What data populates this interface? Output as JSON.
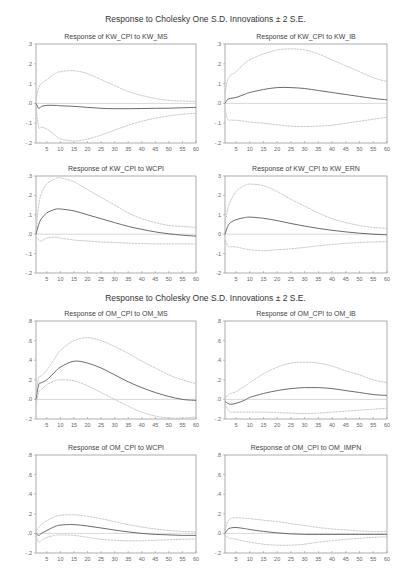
{
  "headers": [
    "Response to Cholesky One S.D. Innovations ± 2 S.E.",
    "Response to Cholesky One S.D. Innovations ± 2 S.E."
  ],
  "chart_data": [
    {
      "type": "line",
      "title": "Response of KW_CPI to KW_MS",
      "x_ticks": [
        5,
        10,
        15,
        20,
        25,
        30,
        35,
        40,
        45,
        50,
        55,
        60
      ],
      "y_ticks": [
        ".3",
        ".2",
        ".1",
        ".0",
        "-.1",
        "-.2"
      ],
      "ylim": [
        -0.2,
        0.3
      ],
      "xlim": [
        1,
        60
      ],
      "x": [
        1,
        2,
        3,
        5,
        8,
        10,
        15,
        20,
        25,
        30,
        35,
        40,
        45,
        50,
        55,
        60
      ],
      "series": [
        {
          "name": "response",
          "values": [
            0.0,
            -0.025,
            -0.015,
            -0.01,
            -0.01,
            -0.012,
            -0.015,
            -0.02,
            -0.025,
            -0.027,
            -0.027,
            -0.026,
            -0.025,
            -0.024,
            -0.022,
            -0.02
          ]
        },
        {
          "name": "upper_2se",
          "values": [
            0.02,
            0.08,
            0.1,
            0.12,
            0.15,
            0.16,
            0.165,
            0.15,
            0.12,
            0.09,
            0.06,
            0.04,
            0.025,
            0.015,
            0.012,
            0.01
          ]
        },
        {
          "name": "lower_2se",
          "values": [
            -0.02,
            -0.12,
            -0.12,
            -0.13,
            -0.16,
            -0.18,
            -0.19,
            -0.18,
            -0.16,
            -0.135,
            -0.11,
            -0.09,
            -0.075,
            -0.063,
            -0.055,
            -0.05
          ]
        }
      ]
    },
    {
      "type": "line",
      "title": "Response of KW_CPI to KW_IB",
      "x_ticks": [
        5,
        10,
        15,
        20,
        25,
        30,
        35,
        40,
        45,
        50,
        55,
        60
      ],
      "y_ticks": [
        ".3",
        ".2",
        ".1",
        ".0",
        "-.1",
        "-.2"
      ],
      "ylim": [
        -0.2,
        0.3
      ],
      "xlim": [
        1,
        60
      ],
      "x": [
        1,
        2,
        3,
        5,
        8,
        10,
        15,
        20,
        25,
        30,
        35,
        40,
        45,
        50,
        55,
        60
      ],
      "series": [
        {
          "name": "response",
          "values": [
            0.0,
            0.02,
            0.025,
            0.03,
            0.045,
            0.055,
            0.07,
            0.08,
            0.08,
            0.075,
            0.065,
            0.055,
            0.045,
            0.035,
            0.025,
            0.018
          ]
        },
        {
          "name": "upper_2se",
          "values": [
            0.05,
            0.12,
            0.14,
            0.16,
            0.2,
            0.22,
            0.25,
            0.27,
            0.275,
            0.27,
            0.25,
            0.22,
            0.19,
            0.16,
            0.13,
            0.11
          ]
        },
        {
          "name": "lower_2se",
          "values": [
            -0.03,
            -0.08,
            -0.085,
            -0.085,
            -0.09,
            -0.095,
            -0.1,
            -0.108,
            -0.115,
            -0.117,
            -0.115,
            -0.11,
            -0.1,
            -0.09,
            -0.08,
            -0.07
          ]
        }
      ]
    },
    {
      "type": "line",
      "title": "Response of KW_CPI to WCPI",
      "x_ticks": [
        5,
        10,
        15,
        20,
        25,
        30,
        35,
        40,
        45,
        50,
        55,
        60
      ],
      "y_ticks": [
        ".3",
        ".2",
        ".1",
        ".0",
        "-.1",
        "-.2"
      ],
      "ylim": [
        -0.2,
        0.3
      ],
      "xlim": [
        1,
        60
      ],
      "x": [
        1,
        2,
        3,
        5,
        8,
        10,
        15,
        20,
        25,
        30,
        35,
        40,
        45,
        50,
        55,
        60
      ],
      "series": [
        {
          "name": "response",
          "values": [
            0.0,
            0.05,
            0.08,
            0.11,
            0.128,
            0.13,
            0.12,
            0.1,
            0.08,
            0.06,
            0.04,
            0.025,
            0.012,
            0.002,
            -0.005,
            -0.01
          ]
        },
        {
          "name": "upper_2se",
          "values": [
            0.02,
            0.15,
            0.21,
            0.26,
            0.285,
            0.29,
            0.27,
            0.23,
            0.19,
            0.15,
            0.11,
            0.08,
            0.06,
            0.045,
            0.04,
            0.035
          ]
        },
        {
          "name": "lower_2se",
          "values": [
            -0.01,
            -0.03,
            -0.035,
            -0.02,
            -0.015,
            -0.02,
            -0.03,
            -0.035,
            -0.04,
            -0.043,
            -0.046,
            -0.048,
            -0.05,
            -0.05,
            -0.05,
            -0.05
          ]
        }
      ]
    },
    {
      "type": "line",
      "title": "Response of KW_CPI to KW_ERN",
      "x_ticks": [
        5,
        10,
        15,
        20,
        25,
        30,
        35,
        40,
        45,
        50,
        55,
        60
      ],
      "y_ticks": [
        "3",
        "2",
        "1",
        "0",
        "-1",
        "-2"
      ],
      "ylim": [
        -2,
        3
      ],
      "xlim": [
        1,
        60
      ],
      "x": [
        1,
        2,
        3,
        5,
        8,
        10,
        15,
        20,
        25,
        30,
        35,
        40,
        45,
        50,
        55,
        60
      ],
      "series": [
        {
          "name": "response",
          "values": [
            0.0,
            0.4,
            0.6,
            0.75,
            0.85,
            0.88,
            0.82,
            0.7,
            0.55,
            0.42,
            0.3,
            0.2,
            0.12,
            0.05,
            0.0,
            -0.03
          ]
        },
        {
          "name": "upper_2se",
          "values": [
            0.5,
            1.3,
            1.7,
            2.2,
            2.5,
            2.58,
            2.5,
            2.2,
            1.8,
            1.45,
            1.1,
            0.8,
            0.6,
            0.45,
            0.35,
            0.3
          ]
        },
        {
          "name": "lower_2se",
          "values": [
            -0.3,
            -0.6,
            -0.65,
            -0.65,
            -0.75,
            -0.8,
            -0.85,
            -0.8,
            -0.75,
            -0.68,
            -0.6,
            -0.53,
            -0.47,
            -0.43,
            -0.4,
            -0.38
          ]
        }
      ]
    },
    {
      "type": "line",
      "title": "Response of OM_CPI to OM_MS",
      "x_ticks": [
        5,
        10,
        15,
        20,
        25,
        30,
        35,
        40,
        45,
        50,
        55,
        60
      ],
      "y_ticks": [
        ".8",
        ".6",
        ".4",
        ".2",
        ".0",
        "-.2"
      ],
      "ylim": [
        -0.2,
        0.8
      ],
      "xlim": [
        1,
        60
      ],
      "x": [
        1,
        2,
        3,
        5,
        8,
        10,
        15,
        20,
        25,
        30,
        35,
        40,
        45,
        50,
        55,
        60
      ],
      "series": [
        {
          "name": "response",
          "values": [
            0.0,
            0.15,
            0.17,
            0.2,
            0.28,
            0.33,
            0.39,
            0.37,
            0.32,
            0.25,
            0.18,
            0.12,
            0.07,
            0.03,
            0.0,
            -0.01
          ]
        },
        {
          "name": "upper_2se",
          "values": [
            0.05,
            0.22,
            0.24,
            0.3,
            0.42,
            0.5,
            0.6,
            0.63,
            0.6,
            0.54,
            0.47,
            0.39,
            0.32,
            0.25,
            0.2,
            0.16
          ]
        },
        {
          "name": "lower_2se",
          "values": [
            -0.05,
            0.07,
            0.1,
            0.15,
            0.19,
            0.2,
            0.19,
            0.14,
            0.07,
            0.0,
            -0.07,
            -0.13,
            -0.17,
            -0.19,
            -0.19,
            -0.18
          ]
        }
      ]
    },
    {
      "type": "line",
      "title": "Response of OM_CPI to OM_IB",
      "x_ticks": [
        5,
        10,
        15,
        20,
        25,
        30,
        35,
        40,
        45,
        50,
        55,
        60
      ],
      "y_ticks": [
        ".8",
        ".6",
        ".4",
        ".2",
        ".0",
        "-.2"
      ],
      "ylim": [
        -0.2,
        0.8
      ],
      "xlim": [
        1,
        60
      ],
      "x": [
        1,
        2,
        3,
        5,
        8,
        10,
        15,
        20,
        25,
        30,
        35,
        40,
        45,
        50,
        55,
        60
      ],
      "series": [
        {
          "name": "response",
          "values": [
            -0.02,
            -0.04,
            -0.05,
            -0.04,
            -0.01,
            0.02,
            0.06,
            0.09,
            0.11,
            0.12,
            0.12,
            0.11,
            0.09,
            0.07,
            0.05,
            0.04
          ]
        },
        {
          "name": "upper_2se",
          "values": [
            0.02,
            0.04,
            0.06,
            0.08,
            0.13,
            0.17,
            0.26,
            0.33,
            0.37,
            0.38,
            0.37,
            0.34,
            0.29,
            0.25,
            0.2,
            0.17
          ]
        },
        {
          "name": "lower_2se",
          "values": [
            -0.05,
            -0.1,
            -0.13,
            -0.13,
            -0.13,
            -0.13,
            -0.13,
            -0.135,
            -0.14,
            -0.145,
            -0.14,
            -0.13,
            -0.12,
            -0.11,
            -0.1,
            -0.09
          ]
        }
      ]
    },
    {
      "type": "line",
      "title": "Response of OM_CPI to WCPI",
      "x_ticks": [
        5,
        10,
        15,
        20,
        25,
        30,
        35,
        40,
        45,
        50,
        55,
        60
      ],
      "y_ticks": [
        ".8",
        ".6",
        ".4",
        ".2",
        ".0",
        "-.2"
      ],
      "ylim": [
        -0.2,
        0.8
      ],
      "xlim": [
        1,
        60
      ],
      "x": [
        1,
        2,
        3,
        5,
        8,
        10,
        15,
        20,
        25,
        30,
        35,
        40,
        45,
        50,
        55,
        60
      ],
      "series": [
        {
          "name": "response",
          "values": [
            0.0,
            -0.02,
            0.0,
            0.03,
            0.07,
            0.085,
            0.09,
            0.075,
            0.055,
            0.035,
            0.015,
            0.0,
            -0.01,
            -0.015,
            -0.02,
            -0.02
          ]
        },
        {
          "name": "upper_2se",
          "values": [
            0.03,
            0.06,
            0.09,
            0.13,
            0.17,
            0.185,
            0.19,
            0.175,
            0.15,
            0.12,
            0.09,
            0.065,
            0.045,
            0.03,
            0.02,
            0.015
          ]
        },
        {
          "name": "lower_2se",
          "values": [
            -0.03,
            -0.09,
            -0.07,
            -0.04,
            -0.02,
            -0.015,
            -0.02,
            -0.04,
            -0.06,
            -0.07,
            -0.075,
            -0.075,
            -0.07,
            -0.065,
            -0.06,
            -0.055
          ]
        }
      ]
    },
    {
      "type": "line",
      "title": "Response of OM_CPI to OM_IMPN",
      "x_ticks": [
        5,
        10,
        15,
        20,
        25,
        30,
        35,
        40,
        45,
        50,
        55,
        60
      ],
      "y_ticks": [
        ".8",
        ".6",
        ".4",
        ".2",
        ".0",
        "-.2"
      ],
      "ylim": [
        -0.2,
        0.8
      ],
      "xlim": [
        1,
        60
      ],
      "x": [
        1,
        2,
        3,
        5,
        8,
        10,
        15,
        20,
        25,
        30,
        35,
        40,
        45,
        50,
        55,
        60
      ],
      "series": [
        {
          "name": "response",
          "values": [
            0.0,
            0.04,
            0.055,
            0.06,
            0.05,
            0.04,
            0.02,
            0.005,
            -0.005,
            -0.01,
            -0.01,
            -0.01,
            -0.01,
            -0.01,
            -0.01,
            -0.01
          ]
        },
        {
          "name": "upper_2se",
          "values": [
            0.03,
            0.12,
            0.15,
            0.16,
            0.155,
            0.15,
            0.135,
            0.12,
            0.1,
            0.08,
            0.06,
            0.045,
            0.035,
            0.025,
            0.02,
            0.02
          ]
        },
        {
          "name": "lower_2se",
          "values": [
            -0.02,
            -0.04,
            -0.05,
            -0.06,
            -0.08,
            -0.09,
            -0.11,
            -0.12,
            -0.12,
            -0.11,
            -0.09,
            -0.075,
            -0.06,
            -0.05,
            -0.04,
            -0.035
          ]
        }
      ]
    }
  ]
}
